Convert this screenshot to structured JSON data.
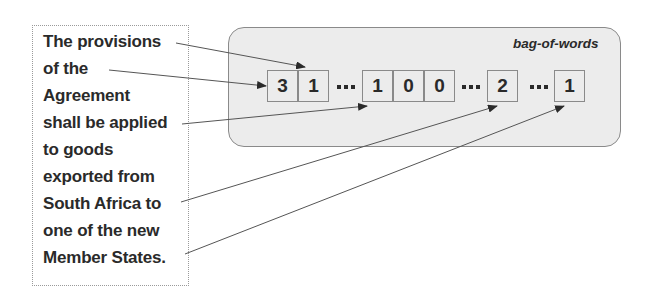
{
  "sentence": {
    "lines": [
      "The provisions",
      "of the",
      "Agreement",
      "shall be applied",
      "to goods",
      "exported from",
      "South Africa to",
      "one of the new",
      "Member States."
    ]
  },
  "bag_of_words": {
    "label": "bag-of-words",
    "cells": [
      "3",
      "1",
      "1",
      "0",
      "0",
      "2",
      "1"
    ],
    "ellipsis": "..."
  },
  "colors": {
    "box_fill": "#ececec",
    "border": "#8a8a8a",
    "text": "#2a2a2a",
    "arrow": "#555555"
  }
}
